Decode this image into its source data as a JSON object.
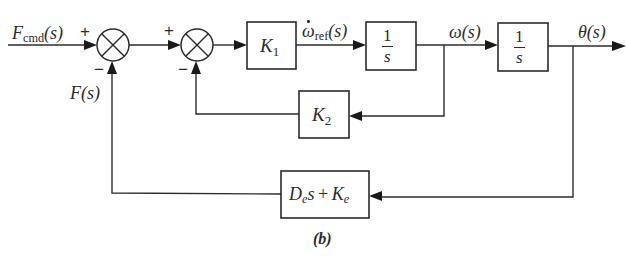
{
  "figure": {
    "caption": "(b)",
    "colors": {
      "line": "#2b2b2b",
      "background": "#ffffff"
    }
  },
  "signals": {
    "input": {
      "symbol": "F",
      "subscript": "cmd",
      "arg": "(s)"
    },
    "feedback_force": {
      "symbol": "F",
      "arg": "(s)"
    },
    "omega_ref_dot": {
      "symbol": "ω",
      "subscript": "ref",
      "arg": "(s)"
    },
    "omega": {
      "symbol": "ω",
      "arg": "(s)"
    },
    "theta": {
      "symbol": "θ",
      "arg": "(s)"
    }
  },
  "summing_junctions": [
    {
      "id": "sum1",
      "top_sign": "+",
      "bottom_sign": "−"
    },
    {
      "id": "sum2",
      "top_sign": "+",
      "bottom_sign": "−"
    }
  ],
  "blocks": {
    "k1": {
      "symbol": "K",
      "subscript": "1"
    },
    "integrator1": {
      "numerator": "1",
      "denominator": "s"
    },
    "integrator2": {
      "numerator": "1",
      "denominator": "s"
    },
    "k2": {
      "symbol": "K",
      "subscript": "2"
    },
    "impedance": {
      "d": "D",
      "d_sub": "e",
      "s": "s",
      "plus": "+",
      "k": "K",
      "k_sub": "e"
    }
  }
}
